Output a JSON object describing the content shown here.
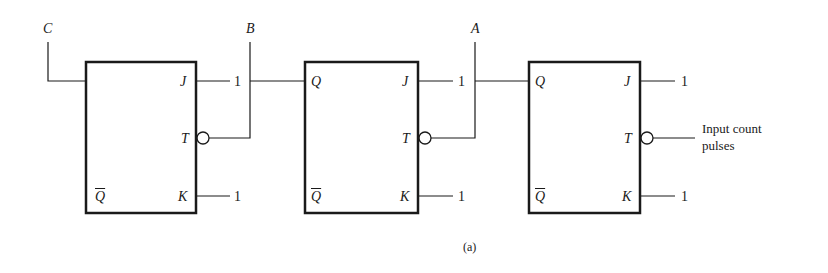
{
  "diagram": {
    "caption": "(a)",
    "signals": {
      "c": "C",
      "b": "B",
      "a": "A"
    },
    "input_label_line1": "Input count",
    "input_label_line2": "pulses",
    "flipflops": [
      {
        "q": "",
        "qbar": "Q",
        "j": "J",
        "t": "T",
        "k": "K",
        "j_val": "1",
        "k_val": "1"
      },
      {
        "q": "Q",
        "qbar": "Q",
        "j": "J",
        "t": "T",
        "k": "K",
        "j_val": "1",
        "k_val": "1"
      },
      {
        "q": "Q",
        "qbar": "Q",
        "j": "J",
        "t": "T",
        "k": "K",
        "j_val": "1",
        "k_val": "1"
      }
    ]
  }
}
